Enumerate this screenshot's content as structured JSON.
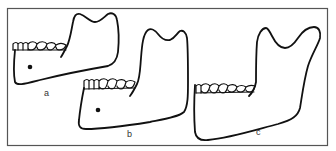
{
  "figure": {
    "type": "line-drawing",
    "border_color": "#555555",
    "stroke_color": "#111111",
    "background": "#ffffff",
    "panels": [
      {
        "id": "a",
        "label": "a"
      },
      {
        "id": "b",
        "label": "b"
      },
      {
        "id": "c",
        "label": "c"
      }
    ]
  }
}
